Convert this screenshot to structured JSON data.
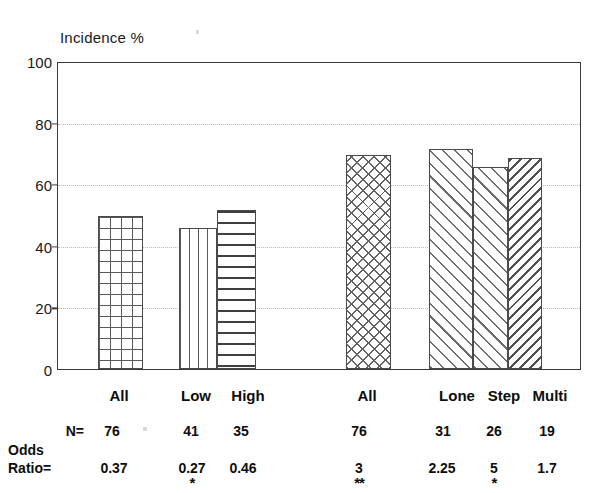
{
  "chart_data": {
    "type": "bar",
    "title": "Incidence %",
    "ylabel": "Incidence %",
    "xlabel": "",
    "ylim": [
      0,
      100
    ],
    "yticks": [
      0,
      20,
      40,
      60,
      80,
      100
    ],
    "gridlines": [
      20,
      40,
      60,
      80
    ],
    "grid": true,
    "legend": "none",
    "categories": [
      "All",
      "Low",
      "High",
      "All",
      "Lone",
      "Step",
      "Multi"
    ],
    "values": [
      50,
      46,
      52,
      70,
      72,
      66,
      69
    ],
    "groups": [
      {
        "name": "group-1",
        "categories": [
          "All",
          "Low",
          "High"
        ]
      },
      {
        "name": "group-2",
        "categories": [
          "All",
          "Lone",
          "Step",
          "Multi"
        ]
      }
    ],
    "bars": [
      {
        "label": "All",
        "value": 50,
        "pattern": "square-grid",
        "group": 1
      },
      {
        "label": "Low",
        "value": 46,
        "pattern": "vertical-lines",
        "group": 1
      },
      {
        "label": "High",
        "value": 52,
        "pattern": "horizontal-lines",
        "group": 1
      },
      {
        "label": "All",
        "value": 70,
        "pattern": "diagonal-crosshatch",
        "group": 2
      },
      {
        "label": "Lone",
        "value": 72,
        "pattern": "forward-diagonal",
        "group": 2
      },
      {
        "label": "Step",
        "value": 66,
        "pattern": "forward-diagonal",
        "group": 2
      },
      {
        "label": "Multi",
        "value": 69,
        "pattern": "backward-diagonal",
        "group": 2
      }
    ],
    "annotations": {
      "row_labels": [
        "N=",
        "Odds",
        "Ratio="
      ],
      "n_values": [
        "76",
        "41",
        "35",
        "76",
        "31",
        "26",
        "19"
      ],
      "odds_ratio_values": [
        "0.37",
        "0.27",
        "0.46",
        "3",
        "2.25",
        "5",
        "1.7"
      ],
      "significance": [
        "",
        "*",
        "",
        "**",
        "",
        "*",
        ""
      ]
    }
  },
  "axis": {
    "title": "Incidence %",
    "ticks": {
      "t100": "100",
      "t80": "80",
      "t60": "60",
      "t40": "40",
      "t20": "20",
      "t0": "0"
    }
  },
  "categories": {
    "c1": "All",
    "c2": "Low",
    "c3": "High",
    "c4": "All",
    "c5": "Lone",
    "c6": "Step",
    "c7": "Multi"
  },
  "table": {
    "label_n": "N=",
    "label_odds_line1": "Odds",
    "label_odds_line2": "Ratio=",
    "n": {
      "n1": "76",
      "n2": "41",
      "n3": "35",
      "n4": "76",
      "n5": "31",
      "n6": "26",
      "n7": "19"
    },
    "odds": {
      "o1": "0.37",
      "o2": "0.27",
      "o3": "0.46",
      "o4": "3",
      "o5": "2.25",
      "o6": "5",
      "o7": "1.7"
    },
    "stars": {
      "s2": "*",
      "s4": "**",
      "s6": "*"
    }
  },
  "colors": {
    "axis": "#3a3a3a",
    "grid": "#b9b9b9",
    "text": "#0d0d0d",
    "bar_outline": "#4a4a4a",
    "background": "#ffffff"
  }
}
